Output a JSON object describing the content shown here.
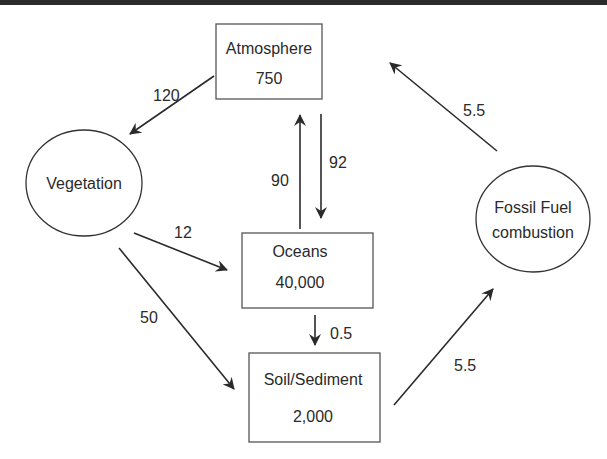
{
  "colors": {
    "stroke": "#2a2a2a",
    "box_border": "#555555",
    "background": "#ffffff",
    "top_band": "#2b2b2b"
  },
  "nodes": {
    "atmosphere": {
      "shape": "rectangle",
      "label": "Atmosphere",
      "value": "750"
    },
    "oceans": {
      "shape": "rectangle",
      "label": "Oceans",
      "value": "40,000"
    },
    "soil": {
      "shape": "rectangle",
      "label": "Soil/Sediment",
      "value": "2,000"
    },
    "vegetation": {
      "shape": "ellipse",
      "label": "Vegetation"
    },
    "fossil": {
      "shape": "ellipse",
      "label_line1": "Fossil Fuel",
      "label_line2": "combustion"
    }
  },
  "flows": {
    "atm_to_veg": {
      "from": "Atmosphere",
      "to": "Vegetation",
      "value": "120"
    },
    "ocean_to_atm": {
      "from": "Oceans",
      "to": "Atmosphere",
      "value": "90"
    },
    "atm_to_ocean": {
      "from": "Atmosphere",
      "to": "Oceans",
      "value": "92"
    },
    "veg_to_ocean": {
      "from": "Vegetation",
      "to": "Oceans",
      "value": "12"
    },
    "veg_to_soil": {
      "from": "Vegetation",
      "to": "Soil/Sediment",
      "value": "50"
    },
    "ocean_to_soil": {
      "from": "Oceans",
      "to": "Soil/Sediment",
      "value": "0.5"
    },
    "soil_to_fossil": {
      "from": "Soil/Sediment",
      "to": "Fossil Fuel combustion",
      "value": "5.5"
    },
    "fossil_to_atm": {
      "from": "Fossil Fuel combustion",
      "to": "Atmosphere",
      "value": "5.5"
    }
  }
}
